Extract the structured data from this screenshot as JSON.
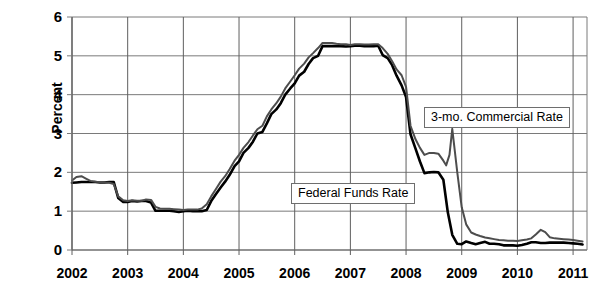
{
  "chart_data": {
    "type": "line",
    "title": "",
    "xlabel": "",
    "ylabel": "Percent",
    "xlim": [
      2002,
      2011.25
    ],
    "ylim": [
      0,
      6
    ],
    "grid": true,
    "legend_position": "inline-callouts",
    "y_ticks": [
      "0",
      "1",
      "2",
      "3",
      "4",
      "5",
      "6"
    ],
    "y_tick_values": [
      0,
      1,
      2,
      3,
      4,
      5,
      6
    ],
    "x_ticks": [
      "2002",
      "2003",
      "2004",
      "2005",
      "2006",
      "2007",
      "2008",
      "2009",
      "2010",
      "2011"
    ],
    "x_tick_values": [
      2002,
      2003,
      2004,
      2005,
      2006,
      2007,
      2008,
      2009,
      2010,
      2011
    ],
    "annotations": [
      {
        "text": "Federal Funds Rate",
        "x": 2006.6,
        "y": 1.55
      },
      {
        "text": "3-mo. Commercial Rate",
        "x": 2009.0,
        "y": 3.45
      }
    ],
    "series": [
      {
        "name": "Federal Funds Rate",
        "color": "#000000",
        "linewidth": 2.6,
        "x": [
          2002.0,
          2002.08,
          2002.17,
          2002.25,
          2002.33,
          2002.42,
          2002.5,
          2002.58,
          2002.67,
          2002.75,
          2002.83,
          2002.92,
          2003.0,
          2003.08,
          2003.17,
          2003.25,
          2003.33,
          2003.42,
          2003.5,
          2003.58,
          2003.67,
          2003.75,
          2003.83,
          2003.92,
          2004.0,
          2004.08,
          2004.17,
          2004.25,
          2004.33,
          2004.42,
          2004.5,
          2004.58,
          2004.67,
          2004.75,
          2004.83,
          2004.92,
          2005.0,
          2005.08,
          2005.17,
          2005.25,
          2005.33,
          2005.42,
          2005.5,
          2005.58,
          2005.67,
          2005.75,
          2005.83,
          2005.92,
          2006.0,
          2006.08,
          2006.17,
          2006.25,
          2006.33,
          2006.42,
          2006.5,
          2006.58,
          2006.67,
          2006.75,
          2006.83,
          2006.92,
          2007.0,
          2007.08,
          2007.17,
          2007.25,
          2007.33,
          2007.42,
          2007.5,
          2007.58,
          2007.67,
          2007.75,
          2007.83,
          2007.92,
          2008.0,
          2008.08,
          2008.17,
          2008.25,
          2008.33,
          2008.42,
          2008.5,
          2008.58,
          2008.67,
          2008.75,
          2008.83,
          2008.92,
          2009.0,
          2009.08,
          2009.17,
          2009.25,
          2009.33,
          2009.42,
          2009.5,
          2009.58,
          2009.67,
          2009.75,
          2009.83,
          2009.92,
          2010.0,
          2010.08,
          2010.17,
          2010.25,
          2010.33,
          2010.42,
          2010.5,
          2010.58,
          2010.67,
          2010.75,
          2010.83,
          2010.92,
          2011.0,
          2011.08,
          2011.17
        ],
        "y": [
          1.73,
          1.74,
          1.75,
          1.75,
          1.75,
          1.75,
          1.74,
          1.74,
          1.75,
          1.75,
          1.34,
          1.24,
          1.24,
          1.26,
          1.25,
          1.26,
          1.26,
          1.22,
          1.01,
          1.01,
          1.01,
          1.01,
          1.0,
          0.98,
          1.0,
          1.01,
          1.0,
          1.0,
          1.0,
          1.03,
          1.26,
          1.43,
          1.61,
          1.76,
          1.93,
          2.16,
          2.28,
          2.5,
          2.63,
          2.79,
          3.0,
          3.04,
          3.26,
          3.5,
          3.62,
          3.78,
          4.0,
          4.16,
          4.29,
          4.49,
          4.59,
          4.79,
          4.94,
          5.0,
          5.25,
          5.25,
          5.25,
          5.25,
          5.25,
          5.24,
          5.25,
          5.26,
          5.26,
          5.25,
          5.25,
          5.25,
          5.26,
          5.02,
          4.94,
          4.76,
          4.49,
          4.24,
          3.94,
          2.98,
          2.61,
          2.28,
          1.98,
          2.0,
          2.01,
          2.0,
          1.81,
          0.97,
          0.39,
          0.16,
          0.15,
          0.22,
          0.18,
          0.15,
          0.18,
          0.21,
          0.16,
          0.16,
          0.15,
          0.12,
          0.12,
          0.12,
          0.11,
          0.13,
          0.16,
          0.2,
          0.2,
          0.18,
          0.18,
          0.19,
          0.19,
          0.19,
          0.19,
          0.18,
          0.17,
          0.16,
          0.14
        ]
      },
      {
        "name": "3-mo. Commercial Rate",
        "color": "#4d4d4d",
        "linewidth": 2.0,
        "x": [
          2002.0,
          2002.08,
          2002.17,
          2002.25,
          2002.33,
          2002.42,
          2002.5,
          2002.58,
          2002.67,
          2002.75,
          2002.83,
          2002.92,
          2003.0,
          2003.08,
          2003.17,
          2003.25,
          2003.33,
          2003.42,
          2003.5,
          2003.58,
          2003.67,
          2003.75,
          2003.83,
          2003.92,
          2004.0,
          2004.08,
          2004.17,
          2004.25,
          2004.33,
          2004.42,
          2004.5,
          2004.58,
          2004.67,
          2004.75,
          2004.83,
          2004.92,
          2005.0,
          2005.08,
          2005.17,
          2005.25,
          2005.33,
          2005.42,
          2005.5,
          2005.58,
          2005.67,
          2005.75,
          2005.83,
          2005.92,
          2006.0,
          2006.08,
          2006.17,
          2006.25,
          2006.33,
          2006.42,
          2006.5,
          2006.58,
          2006.67,
          2006.75,
          2006.83,
          2006.92,
          2007.0,
          2007.08,
          2007.17,
          2007.25,
          2007.33,
          2007.42,
          2007.5,
          2007.58,
          2007.67,
          2007.75,
          2007.83,
          2007.92,
          2008.0,
          2008.08,
          2008.17,
          2008.25,
          2008.33,
          2008.42,
          2008.5,
          2008.58,
          2008.67,
          2008.72,
          2008.78,
          2008.83,
          2008.92,
          2009.0,
          2009.08,
          2009.17,
          2009.25,
          2009.33,
          2009.42,
          2009.5,
          2009.58,
          2009.67,
          2009.75,
          2009.83,
          2009.92,
          2010.0,
          2010.08,
          2010.17,
          2010.25,
          2010.33,
          2010.42,
          2010.5,
          2010.58,
          2010.67,
          2010.75,
          2010.83,
          2010.92,
          2011.0,
          2011.08,
          2011.17
        ],
        "y": [
          1.79,
          1.88,
          1.9,
          1.84,
          1.78,
          1.76,
          1.75,
          1.74,
          1.73,
          1.7,
          1.38,
          1.28,
          1.26,
          1.28,
          1.27,
          1.27,
          1.3,
          1.29,
          1.11,
          1.07,
          1.06,
          1.06,
          1.05,
          1.04,
          1.03,
          1.04,
          1.04,
          1.04,
          1.07,
          1.18,
          1.38,
          1.56,
          1.76,
          1.9,
          2.08,
          2.3,
          2.45,
          2.63,
          2.78,
          2.95,
          3.11,
          3.2,
          3.44,
          3.62,
          3.78,
          3.95,
          4.16,
          4.34,
          4.5,
          4.67,
          4.8,
          4.96,
          5.07,
          5.2,
          5.33,
          5.33,
          5.33,
          5.31,
          5.3,
          5.3,
          5.28,
          5.3,
          5.3,
          5.29,
          5.29,
          5.3,
          5.3,
          5.2,
          5.05,
          4.86,
          4.65,
          4.5,
          4.2,
          3.2,
          2.85,
          2.63,
          2.45,
          2.5,
          2.5,
          2.48,
          2.3,
          2.18,
          2.45,
          3.12,
          2.0,
          1.1,
          0.66,
          0.45,
          0.4,
          0.36,
          0.32,
          0.3,
          0.28,
          0.26,
          0.25,
          0.24,
          0.24,
          0.23,
          0.25,
          0.27,
          0.3,
          0.4,
          0.52,
          0.46,
          0.33,
          0.3,
          0.29,
          0.28,
          0.27,
          0.26,
          0.24,
          0.22
        ]
      }
    ]
  },
  "axis": {
    "y_title": "Percent"
  }
}
